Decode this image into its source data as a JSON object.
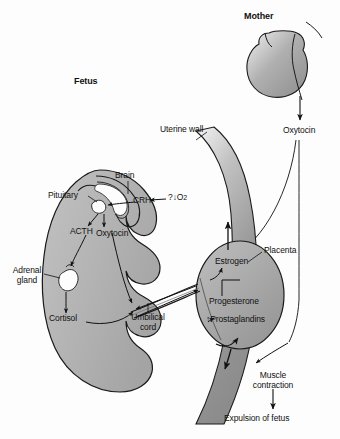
{
  "diagram": {
    "background_color": "#fdfdfd",
    "outline_color": "#1a1a1a",
    "fetus_fill": "#b5b5b5",
    "placenta_fill": "#a6a6a6",
    "uterus_fill": "#9c9c9c",
    "mother_fill": "#a9a9a9",
    "gland_fill": "#fbfbfb",
    "labels": {
      "mother": "Mother",
      "fetus": "Fetus",
      "uterine_wall": "Uterine wall",
      "oxytocin_mother": "Oxytocin",
      "brain": "Brain",
      "pituitary": "Pituitary",
      "crh": "CRH",
      "low_oxygen": "?↓O",
      "low_oxygen_sub": "2",
      "acth": "ACTH",
      "oxytocin_fetus": "Oxytocin",
      "adrenal_gland_line1": "Adrenal",
      "adrenal_gland_line2": "gland",
      "cortisol": "Cortisol",
      "umbilical_cord_line1": "Umbilical",
      "umbilical_cord_line2": "cord",
      "placenta": "Placenta",
      "estrogen": "Estrogen",
      "progesterone": "Progesterone",
      "prostaglandins": "↑Prostaglandins",
      "muscle_contraction_line1": "Muscle",
      "muscle_contraction_line2": "contraction",
      "expulsion": "Expulsion of fetus"
    },
    "icons": {
      "arrow": "arrow-head-icon",
      "leader": "leader-line-icon"
    }
  }
}
